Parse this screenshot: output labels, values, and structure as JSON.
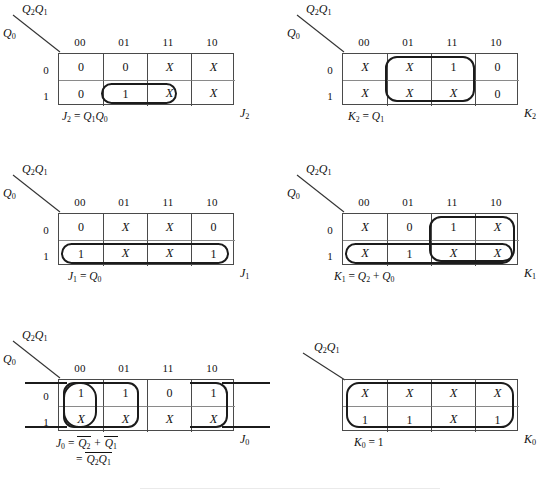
{
  "figure": {
    "col_headers": [
      "00",
      "01",
      "11",
      "10"
    ],
    "row_headers": [
      "0",
      "1"
    ],
    "top_var": "Q2Q1",
    "left_var": "Q0"
  },
  "maps": [
    {
      "id": "j2",
      "label": "J2",
      "top_var_html": "Q<sub>2</sub>Q<sub>1</sub>",
      "left_var_html": "Q<sub>0</sub>",
      "col_headers": [
        "00",
        "01",
        "11",
        "10"
      ],
      "row_headers": [
        "0",
        "1"
      ],
      "cells": [
        [
          "0",
          "0",
          "X",
          "X"
        ],
        [
          "0",
          "1",
          "X",
          "X"
        ]
      ],
      "equations": [
        "J2 = Q1Q0"
      ],
      "equations_html": [
        "<i>J</i><sub>2</sub> = <i>Q</i><sub>1</sub><i>Q</i><sub>0</sub>"
      ],
      "groups": [
        {
          "name": "group-row1-col01-11",
          "row": 1,
          "col": 1,
          "rowspan": 1,
          "colspan": 2,
          "wrap": false
        }
      ]
    },
    {
      "id": "k2",
      "label": "K2",
      "top_var_html": "Q<sub>2</sub>Q<sub>1</sub>",
      "left_var_html": "Q<sub>0</sub>",
      "col_headers": [
        "00",
        "01",
        "11",
        "10"
      ],
      "row_headers": [
        "0",
        "1"
      ],
      "cells": [
        [
          "X",
          "X",
          "1",
          "0"
        ],
        [
          "X",
          "X",
          "X",
          "0"
        ]
      ],
      "equations": [
        "K2 = Q1"
      ],
      "equations_html": [
        "<i>K</i><sub>2</sub> = <i>Q</i><sub>1</sub>"
      ],
      "groups": [
        {
          "name": "group-col01-11-both-rows",
          "row": 0,
          "col": 1,
          "rowspan": 2,
          "colspan": 2,
          "wrap": false
        }
      ]
    },
    {
      "id": "j1",
      "label": "J1",
      "top_var_html": "Q<sub>2</sub>Q<sub>1</sub>",
      "left_var_html": "Q<sub>0</sub>",
      "col_headers": [
        "00",
        "01",
        "11",
        "10"
      ],
      "row_headers": [
        "0",
        "1"
      ],
      "cells": [
        [
          "0",
          "X",
          "X",
          "0"
        ],
        [
          "1",
          "X",
          "X",
          "1"
        ]
      ],
      "equations": [
        "J1 = Q0"
      ],
      "equations_html": [
        "<i>J</i><sub>1</sub> = <i>Q</i><sub>0</sub>"
      ],
      "groups": [
        {
          "name": "group-row1-all-cols",
          "row": 1,
          "col": 0,
          "rowspan": 1,
          "colspan": 4,
          "wrap": false
        }
      ]
    },
    {
      "id": "k1",
      "label": "K1",
      "top_var_html": "Q<sub>2</sub>Q<sub>1</sub>",
      "left_var_html": "Q<sub>0</sub>",
      "col_headers": [
        "00",
        "01",
        "11",
        "10"
      ],
      "row_headers": [
        "0",
        "1"
      ],
      "cells": [
        [
          "X",
          "0",
          "1",
          "X"
        ],
        [
          "X",
          "1",
          "X",
          "X"
        ]
      ],
      "equations": [
        "K1 = Q2 + Q0"
      ],
      "equations_html": [
        "<i>K</i><sub>1</sub> = <i>Q</i><sub>2</sub> + <i>Q</i><sub>0</sub>"
      ],
      "groups": [
        {
          "name": "group-col11-10-both-rows",
          "row": 0,
          "col": 2,
          "rowspan": 2,
          "colspan": 2,
          "wrap": false
        },
        {
          "name": "group-row1-all-cols",
          "row": 1,
          "col": 0,
          "rowspan": 1,
          "colspan": 4,
          "wrap": false
        }
      ]
    },
    {
      "id": "j0",
      "label": "J0",
      "top_var_html": "Q<sub>2</sub>Q<sub>1</sub>",
      "left_var_html": "Q<sub>0</sub>",
      "col_headers": [
        "00",
        "01",
        "11",
        "10"
      ],
      "row_headers": [
        "0",
        "1"
      ],
      "cells": [
        [
          "1",
          "1",
          "0",
          "1"
        ],
        [
          "X",
          "X",
          "X",
          "X"
        ]
      ],
      "equations": [
        "J0 = Q2' + Q1'",
        "= (Q2Q1)'"
      ],
      "equations_html": [
        "<i>J</i><sub>0</sub> = <span class=\"ov\"><i>Q</i><sub>2</sub></span> + <span class=\"ov\"><i>Q</i><sub>1</sub></span>",
        "= <span class=\"ov\"><i>Q</i><sub>2</sub><i>Q</i><sub>1</sub></span>"
      ],
      "groups": [
        {
          "name": "group-col00-both-rows",
          "row": 0,
          "col": 0,
          "rowspan": 2,
          "colspan": 1,
          "wrap": false
        },
        {
          "name": "group-col00-01-both-rows",
          "row": 0,
          "col": 0,
          "rowspan": 2,
          "colspan": 2,
          "wrap": false
        },
        {
          "name": "group-col10-wraparound",
          "row": 0,
          "col": 3,
          "rowspan": 2,
          "colspan": 1,
          "wrap": true
        }
      ]
    },
    {
      "id": "k0",
      "label": "K0",
      "top_var_html": "Q<sub>2</sub>Q<sub>1</sub>",
      "left_var_html": "",
      "col_headers": [],
      "row_headers": [],
      "cells": [
        [
          "X",
          "X",
          "X",
          "X"
        ],
        [
          "1",
          "1",
          "X",
          "1"
        ]
      ],
      "equations": [
        "K0 = 1"
      ],
      "equations_html": [
        "<i>K</i><sub>0</sub> = 1"
      ],
      "groups": [
        {
          "name": "group-all-cells",
          "row": 0,
          "col": 0,
          "rowspan": 2,
          "colspan": 4,
          "wrap": false
        }
      ]
    }
  ]
}
